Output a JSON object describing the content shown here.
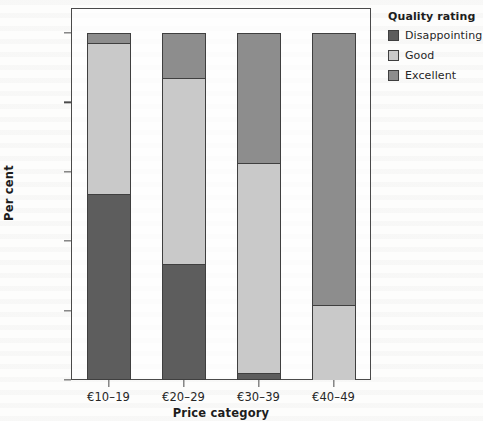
{
  "chart_data": {
    "type": "bar",
    "subtype": "stacked-100-percent",
    "title": "",
    "xlabel": "Price category",
    "ylabel": "Per cent",
    "categories": [
      "€10–19",
      "€20–29",
      "€30–39",
      "€40–49"
    ],
    "series": [
      {
        "name": "Disappointing",
        "color": "#5d5d5d",
        "values": [
          53.5,
          33.5,
          2.0,
          0.0
        ]
      },
      {
        "name": "Good",
        "color": "#c9c9c9",
        "values": [
          43.5,
          53.5,
          60.5,
          21.5
        ]
      },
      {
        "name": "Excellent",
        "color": "#8d8d8d",
        "values": [
          3.0,
          13.0,
          37.5,
          78.5
        ]
      }
    ],
    "stack_order_bottom_to_top": [
      "Disappointing",
      "Good",
      "Excellent"
    ],
    "ylim": [
      0,
      100
    ],
    "yticks": [
      0,
      20,
      40,
      60,
      80,
      100
    ],
    "ytick_labels": [
      "0%",
      "20%",
      "40%",
      "60%",
      "80%",
      "100%"
    ],
    "grid": false,
    "legend_title": "Quality rating",
    "legend_position": "right-top"
  },
  "legend": {
    "title": "Quality rating",
    "items": [
      {
        "label": "Disappointing",
        "color": "#5d5d5d"
      },
      {
        "label": "Good",
        "color": "#c9c9c9"
      },
      {
        "label": "Excellent",
        "color": "#8d8d8d"
      }
    ]
  },
  "axes": {
    "y_title": "Per cent",
    "x_title": "Price category",
    "y_tick_labels": [
      "100%",
      "80%",
      "60%",
      "40%",
      "20%",
      "0%"
    ],
    "x_tick_labels": [
      "€10–19",
      "€20–29",
      "€30–39",
      "€40–49"
    ]
  },
  "colors": {
    "disappointing": "#5d5d5d",
    "good": "#c9c9c9",
    "excellent": "#8d8d8d",
    "frame": "#4a4a4a",
    "text": "#262626"
  }
}
